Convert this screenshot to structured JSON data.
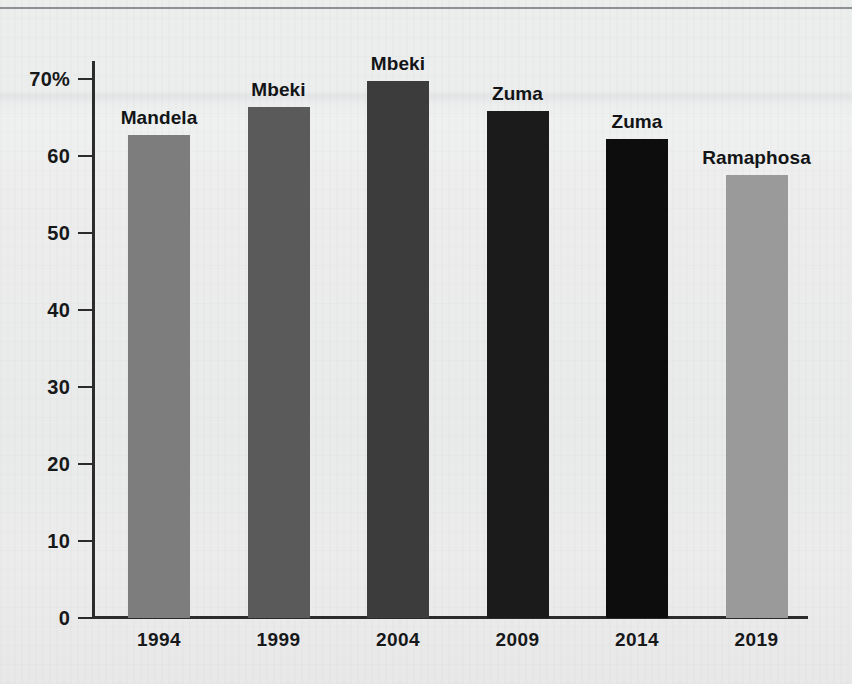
{
  "chart_data": {
    "type": "bar",
    "title": "",
    "subtitle": "",
    "xlabel": "",
    "ylabel": "",
    "categories": [
      "1994",
      "1999",
      "2004",
      "2009",
      "2014",
      "2019"
    ],
    "values": [
      62.7,
      66.4,
      69.7,
      65.9,
      62.2,
      57.5
    ],
    "point_labels": [
      "Mandela",
      "Mbeki",
      "Mbeki",
      "Zuma",
      "Zuma",
      "Ramaphosa"
    ],
    "bar_colors": [
      "#7d7d7d",
      "#5a5a5a",
      "#3c3c3c",
      "#1b1b1b",
      "#0d0d0d",
      "#9a9a9a"
    ],
    "ylim": [
      0,
      73
    ],
    "ytick_values": [
      0,
      10,
      20,
      30,
      40,
      50,
      60,
      70
    ],
    "ytick_labels": [
      "0",
      "10",
      "20",
      "30",
      "40",
      "50",
      "60",
      "70%"
    ],
    "grid": false,
    "legend": "none",
    "unit": "%",
    "series": [
      {
        "name": "Share of vote",
        "points": [
          {
            "x": "1994",
            "y": 62.7,
            "label": "Mandela",
            "color": "#7d7d7d"
          },
          {
            "x": "1999",
            "y": 66.4,
            "label": "Mbeki",
            "color": "#5a5a5a"
          },
          {
            "x": "2004",
            "y": 69.7,
            "label": "Mbeki",
            "color": "#3c3c3c"
          },
          {
            "x": "2009",
            "y": 65.9,
            "label": "Zuma",
            "color": "#1b1b1b"
          },
          {
            "x": "2014",
            "y": 62.2,
            "label": "Zuma",
            "color": "#0d0d0d"
          },
          {
            "x": "2019",
            "y": 57.5,
            "label": "Ramaphosa",
            "color": "#9a9a9a"
          }
        ]
      }
    ]
  },
  "axis": {
    "axis_color": "#2b2b2b",
    "tick_color": "#2b2b2b",
    "label_color": "#16181a"
  },
  "page": {
    "background": "#eceded",
    "rule_color": "#8d9094"
  }
}
